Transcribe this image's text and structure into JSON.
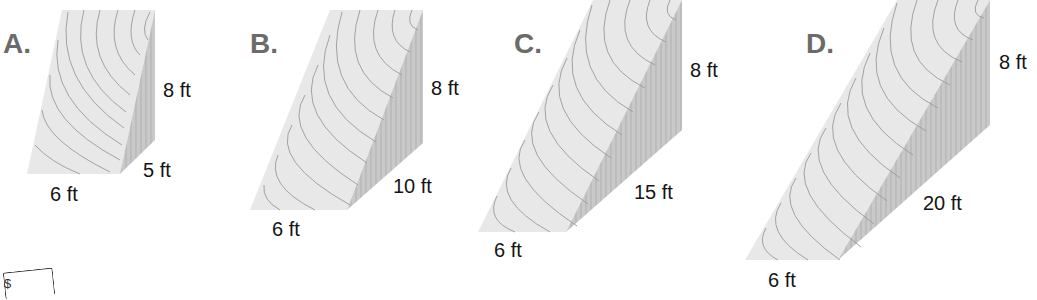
{
  "figure": {
    "type": "triangular-prism-comparison",
    "colors": {
      "front_face": "#e8e8e8",
      "side_face": "#c9c9c9",
      "grain": "#9a9a9a",
      "letter": "#6b6b6b",
      "dimension_text": "#141414"
    },
    "prisms": [
      {
        "letter": "A.",
        "height": "8 ft",
        "length": "5 ft",
        "base": "6 ft"
      },
      {
        "letter": "B.",
        "height": "8 ft",
        "length": "10 ft",
        "base": "6 ft"
      },
      {
        "letter": "C.",
        "height": "8 ft",
        "length": "15 ft",
        "base": "6 ft"
      },
      {
        "letter": "D.",
        "height": "8 ft",
        "length": "20 ft",
        "base": "6 ft"
      }
    ],
    "corner_icon": "note-icon",
    "corner_glyph": "$"
  }
}
